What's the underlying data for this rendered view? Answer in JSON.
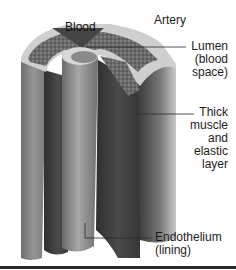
{
  "figure": {
    "title": "Artery",
    "inner_label": "Blood",
    "labels": [
      {
        "id": "lumen",
        "text": "Lumen\n(blood\nspace)"
      },
      {
        "id": "muscle",
        "text": "Thick\nmuscle\nand\nelastic\nlayer"
      },
      {
        "id": "endothelium",
        "text": "Endothelium\n(lining)"
      }
    ]
  },
  "colors": {
    "outer_wall": "#8a8a8a",
    "outer_rim": "#c8c8c8",
    "muscle_dark": "#3e3e3e",
    "muscle_mid": "#5a5a5a",
    "textured": "#6e6e6e",
    "lumen_core": "#9c9c9c",
    "blood": "#4a4a4a",
    "text": "#1c1c1c"
  }
}
